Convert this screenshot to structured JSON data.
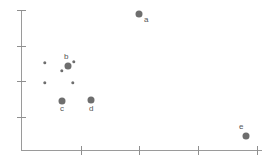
{
  "chart_data": {
    "type": "scatter",
    "title": "",
    "xlabel": "",
    "ylabel": "",
    "grid": false,
    "legend": null,
    "xlim": [
      0,
      4.1
    ],
    "ylim": [
      0,
      4.0
    ],
    "xtick_labels": [
      "",
      "",
      "",
      ""
    ],
    "ytick_labels": [
      "",
      "",
      "",
      ""
    ],
    "xticks": [
      1,
      2,
      3,
      4
    ],
    "yticks": [
      4,
      3,
      2,
      1
    ],
    "series": [
      {
        "name": "labeled points",
        "marker": "circle",
        "marker_size": "large",
        "color": "#6e6e6e",
        "points": [
          {
            "label": "a",
            "x": 2.0,
            "y": 3.83,
            "px": 139,
            "py": 14,
            "label_dx": 5,
            "label_dy": 2
          },
          {
            "label": "b",
            "x": 0.79,
            "y": 2.38,
            "px": 68,
            "py": 66,
            "label_dx": -4,
            "label_dy": -13
          },
          {
            "label": "c",
            "x": 0.69,
            "y": 1.39,
            "px": 62,
            "py": 101,
            "label_dx": -2,
            "label_dy": 4
          },
          {
            "label": "d",
            "x": 1.19,
            "y": 1.41,
            "px": 91,
            "py": 100,
            "label_dx": -2,
            "label_dy": 5
          },
          {
            "label": "e",
            "x": 3.83,
            "y": 0.4,
            "px": 246,
            "py": 136,
            "label_dx": -7,
            "label_dy": -13
          }
        ]
      },
      {
        "name": "unlabeled points",
        "marker": "circle",
        "marker_size": "small",
        "color": "#6e6e6e",
        "points": [
          {
            "label": "",
            "x": 0.41,
            "y": 2.46,
            "px": 45,
            "py": 63
          },
          {
            "label": "",
            "x": 0.9,
            "y": 2.49,
            "px": 74,
            "py": 62
          },
          {
            "label": "",
            "x": 0.69,
            "y": 2.23,
            "px": 62,
            "py": 71
          },
          {
            "label": "",
            "x": 0.41,
            "y": 1.89,
            "px": 45,
            "py": 83
          },
          {
            "label": "",
            "x": 0.89,
            "y": 1.89,
            "px": 73,
            "py": 83
          }
        ]
      }
    ],
    "axis_pixels": {
      "x_axis_y": 150,
      "y_axis_x": 21,
      "x_axis_left": 21,
      "x_axis_right": 262,
      "y_axis_top": 10,
      "y_axis_bottom": 151,
      "xtick_px": [
        81,
        139,
        198,
        257
      ],
      "ytick_px": [
        10,
        46,
        81,
        117
      ]
    },
    "colors": {
      "marker": "#6e6e6e",
      "axis": "#9a9a9a",
      "tick": "#8f8f8f",
      "label_text": "#555555",
      "background": "#ffffff"
    }
  }
}
